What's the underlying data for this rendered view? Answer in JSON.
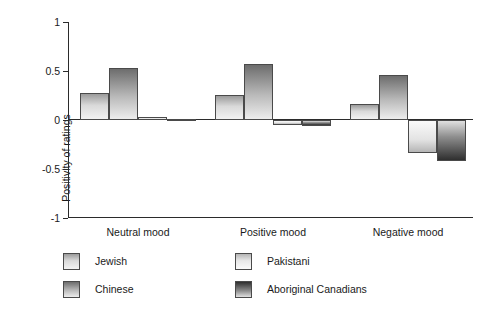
{
  "chart_data": {
    "type": "bar",
    "title": "",
    "xlabel": "",
    "ylabel": "Positivity of ratings",
    "ylim": [
      -1,
      1
    ],
    "yticks": [
      "1",
      "0.5",
      "0",
      "-0.5",
      "-1"
    ],
    "ytick_values": [
      1,
      0.5,
      0,
      -0.5,
      -1
    ],
    "grid": false,
    "legend_position": "bottom-left",
    "categories": [
      "Neutral mood",
      "Positive mood",
      "Negative mood"
    ],
    "series": [
      {
        "name": "Jewish",
        "values": [
          0.28,
          0.26,
          0.16
        ]
      },
      {
        "name": "Chinese",
        "values": [
          0.53,
          0.57,
          0.46
        ]
      },
      {
        "name": "Pakistani",
        "values": [
          0.03,
          -0.05,
          -0.34
        ]
      },
      {
        "name": "Aboriginal Canadians",
        "values": [
          0.01,
          -0.06,
          -0.42
        ]
      }
    ]
  },
  "axes": {
    "y_title": "Positivity of ratings"
  },
  "legend": {
    "items": [
      {
        "label": "Jewish"
      },
      {
        "label": "Chinese"
      },
      {
        "label": "Pakistani"
      },
      {
        "label": "Aboriginal Canadians"
      }
    ]
  }
}
